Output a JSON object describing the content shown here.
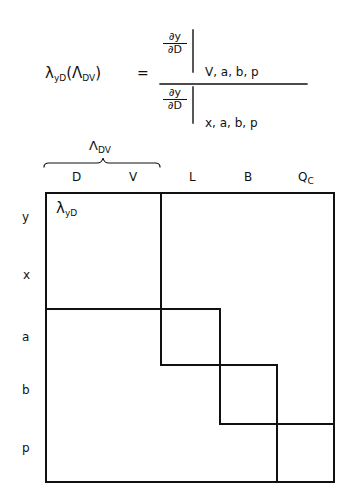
{
  "formula": {
    "lhs_symbol": "λ",
    "lhs_sub": "yD",
    "lhs_paren_open": "(",
    "lhs_arg_symbol": "Λ",
    "lhs_arg_sub": "DV",
    "lhs_paren_close": ")",
    "equals": "=",
    "numerator": {
      "top": "∂y",
      "bottom": "∂D",
      "held_constant": "V,  a,  b,  p"
    },
    "denominator": {
      "top": "∂y",
      "bottom": "∂D",
      "held_constant": "x,  a,  b,  p"
    }
  },
  "brace": {
    "symbol": "Λ",
    "sub": "DV"
  },
  "columns": [
    {
      "label": "D",
      "sub": ""
    },
    {
      "label": "V",
      "sub": ""
    },
    {
      "label": "L",
      "sub": ""
    },
    {
      "label": "B",
      "sub": ""
    },
    {
      "label": "Q",
      "sub": "C"
    }
  ],
  "rows": [
    "y",
    "x",
    "a",
    "b",
    "p"
  ],
  "cell_annotation": {
    "symbol": "λ",
    "sub": "yD"
  },
  "colors": {
    "ink": "#111111",
    "background": "#ffffff"
  }
}
